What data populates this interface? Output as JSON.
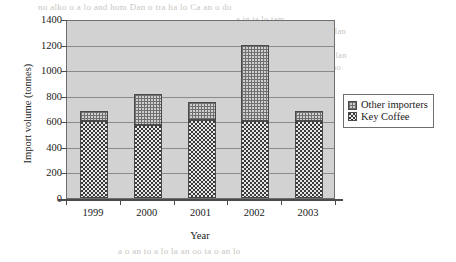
{
  "chart_data": {
    "type": "bar",
    "title": "",
    "subtitle": "",
    "xlabel": "Year",
    "ylabel": "Import volume (tonnes)",
    "categories": [
      "1999",
      "2000",
      "2001",
      "2002",
      "2003"
    ],
    "ylim": [
      0,
      1400
    ],
    "yticks": [
      "0",
      "200",
      "400",
      "600",
      "800",
      "1000",
      "1200",
      "1400"
    ],
    "ytick_values": [
      0,
      200,
      400,
      600,
      800,
      1000,
      1200,
      1400
    ],
    "grid": true,
    "grid_axis": "y",
    "stacked": true,
    "legend_position": "right",
    "series": [
      {
        "name": "Key Coffee",
        "pattern": "dark-checkerboard",
        "color": "#3a3a3a",
        "values": [
          600,
          570,
          610,
          600,
          600
        ]
      },
      {
        "name": "Other importers",
        "pattern": "light-crosshatch",
        "color": "#cfcfcf",
        "values": [
          80,
          240,
          140,
          600,
          80
        ]
      }
    ],
    "totals": [
      680,
      810,
      750,
      1200,
      680
    ],
    "plot_background": "#d2d2d2"
  },
  "legend": {
    "entries": [
      {
        "label": "Other importers",
        "swatch": "light-crosshatch"
      },
      {
        "label": "Key Coffee",
        "swatch": "dark-checkerboard"
      }
    ]
  },
  "bleed_text": {
    "line_top_1": "no alko o a lo and hom Dan o tra ha lo Ca an o do",
    "line_top_2": "a in ta lo tam",
    "line_top_3": "n olo o talan",
    "line_top_4": "lo a in la o",
    "line_top_5": "tlo lo a o lan",
    "line_top_6": "a o   a oo",
    "line_bottom_1": "a o an to a lo la an oo ta o an lo"
  }
}
